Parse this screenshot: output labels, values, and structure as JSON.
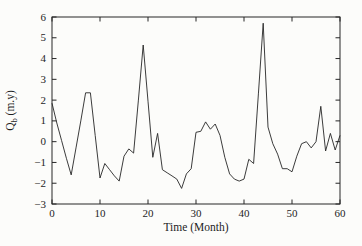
{
  "figure": {
    "background": "#fcfcfa",
    "line_color": "#262626",
    "axis_color": "#262626"
  },
  "chart_data": {
    "type": "line",
    "title": "",
    "xlabel": "Time (Month)",
    "ylabel": "Qb (m.y)",
    "ylabel_parts": {
      "main": "Q",
      "sub": "b",
      "rest": " (m.y)"
    },
    "xlim": [
      0,
      60
    ],
    "ylim": [
      -3,
      6
    ],
    "xticks": [
      0,
      10,
      20,
      30,
      40,
      50,
      60
    ],
    "xtick_labels": [
      "0",
      "10",
      "20",
      "30",
      "40",
      "50",
      "60"
    ],
    "yticks": [
      -3,
      -2,
      -1,
      0,
      1,
      2,
      3,
      4,
      5,
      6
    ],
    "ytick_labels": [
      "−3",
      "−2",
      "−1",
      "0",
      "1",
      "2",
      "3",
      "4",
      "5",
      "6"
    ],
    "grid": false,
    "legend": null,
    "series": [
      {
        "name": "Qb",
        "x": [
          0,
          1,
          2,
          3,
          4,
          5,
          6,
          7,
          8,
          9,
          10,
          11,
          12,
          13,
          14,
          15,
          16,
          17,
          18,
          19,
          20,
          21,
          22,
          23,
          24,
          25,
          26,
          27,
          28,
          29,
          30,
          31,
          32,
          33,
          34,
          35,
          36,
          37,
          38,
          39,
          40,
          41,
          42,
          43,
          44,
          45,
          46,
          47,
          48,
          49,
          50,
          51,
          52,
          53,
          54,
          55,
          56,
          57,
          58,
          59,
          60
        ],
        "values": [
          1.85,
          0.9,
          0.05,
          -0.8,
          -1.6,
          -0.3,
          1.0,
          2.35,
          2.35,
          0.3,
          -1.75,
          -1.05,
          -1.35,
          -1.65,
          -1.9,
          -0.7,
          -0.35,
          -0.55,
          2.0,
          4.65,
          1.95,
          -0.75,
          0.4,
          -1.35,
          -1.5,
          -1.65,
          -1.8,
          -2.25,
          -1.55,
          -1.3,
          0.45,
          0.5,
          0.95,
          0.6,
          0.85,
          0.3,
          -0.75,
          -1.55,
          -1.8,
          -1.9,
          -1.8,
          -0.85,
          -1.05,
          2.3,
          5.7,
          0.7,
          -0.1,
          -0.6,
          -1.3,
          -1.3,
          -1.45,
          -0.7,
          -0.1,
          0.0,
          -0.3,
          0.0,
          1.7,
          -0.45,
          0.4,
          -0.4,
          0.3
        ]
      }
    ]
  }
}
